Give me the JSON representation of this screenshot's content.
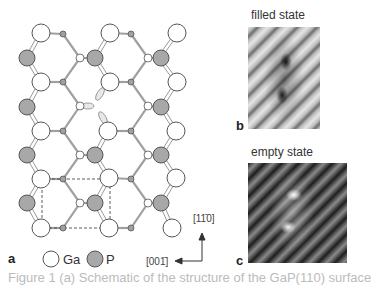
{
  "figure": {
    "panels": {
      "a": {
        "label": "a"
      },
      "b": {
        "label": "b",
        "title": "filled state"
      },
      "c": {
        "label": "c",
        "title": "empty state"
      }
    },
    "legend": [
      {
        "symbol": "white-circle",
        "label": "Ga"
      },
      {
        "symbol": "gray-circle",
        "label": "P"
      }
    ],
    "axes": {
      "vertical": "[11̄0]",
      "horizontal": "[001̄]"
    },
    "caption": "Figure 1 (a) Schematic of the structure of the GaP(110) surface",
    "colors": {
      "ga_fill": "#ffffff",
      "p_fill": "#a8a8a8",
      "bond": "#9a9a9a",
      "outline": "#555555"
    }
  }
}
